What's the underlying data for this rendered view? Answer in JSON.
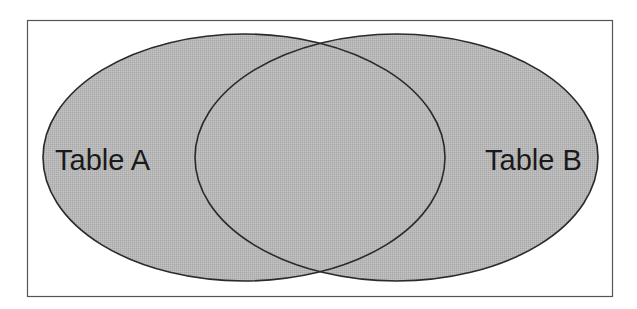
{
  "diagram": {
    "type": "venn",
    "frame": {
      "x": 27,
      "y": 20,
      "width": 585,
      "height": 276,
      "stroke": "#555555"
    },
    "style": {
      "fill": "#b4b4b4",
      "stroke": "#2a2a2a"
    },
    "sets": [
      {
        "id": "A",
        "label": "Table A",
        "cx": 244,
        "cy": 157.5,
        "rx": 201,
        "ry": 123.5,
        "label_x": 55,
        "label_y": 170
      },
      {
        "id": "B",
        "label": "Table B",
        "cx": 396.5,
        "cy": 157.5,
        "rx": 201.5,
        "ry": 123.5,
        "label_x": 485,
        "label_y": 170
      }
    ]
  }
}
